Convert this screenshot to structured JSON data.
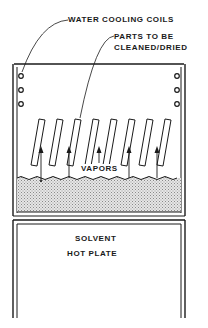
{
  "diagram": {
    "labels": {
      "cooling_coils": "WATER COOLING COILS",
      "parts_line1": "PARTS TO BE",
      "parts_line2": "CLEANED/DRIED",
      "vapors": "VAPORS",
      "solvent": "SOLVENT",
      "hot_plate": "HOT PLATE"
    },
    "components": {
      "tank": "vapor degreaser tank",
      "cooling_coils_per_side": 3,
      "parts_count": 8,
      "vapor_arrows": 5
    },
    "colors": {
      "line": "#1a1a1a",
      "solvent_fill": "#cfcfcf",
      "background": "#ffffff"
    }
  }
}
